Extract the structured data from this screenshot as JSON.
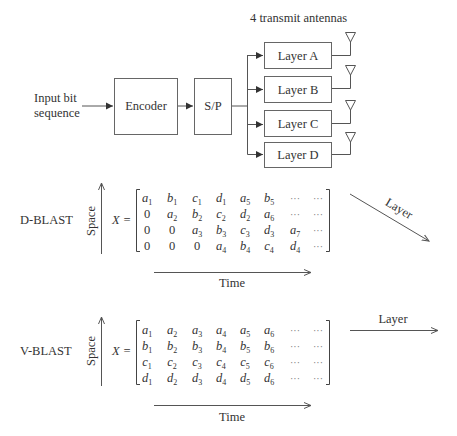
{
  "colors": {
    "ink": "#333333",
    "line": "#555555",
    "background": "#ffffff"
  },
  "block_diagram": {
    "title": "4 transmit antennas",
    "input_label": [
      "Input bit",
      "sequence"
    ],
    "encoder_label": "Encoder",
    "sp_label": "S/P",
    "layers": [
      "Layer A",
      "Layer B",
      "Layer C",
      "Layer D"
    ],
    "antenna_icon": "antenna-triangle-icon"
  },
  "d_blast": {
    "name": "D-BLAST",
    "space_label": "Space",
    "time_label": "Time",
    "layer_label": "Layer",
    "matrix_lhs": "X =",
    "rows": [
      [
        [
          "a",
          "1"
        ],
        [
          "b",
          "1"
        ],
        [
          "c",
          "1"
        ],
        [
          "d",
          "1"
        ],
        [
          "a",
          "5"
        ],
        [
          "b",
          "5"
        ],
        [
          "…",
          ""
        ],
        [
          "…",
          ""
        ]
      ],
      [
        [
          "0",
          ""
        ],
        [
          "a",
          "2"
        ],
        [
          "b",
          "2"
        ],
        [
          "c",
          "2"
        ],
        [
          "d",
          "2"
        ],
        [
          "a",
          "6"
        ],
        [
          "…",
          ""
        ],
        [
          "…",
          ""
        ]
      ],
      [
        [
          "0",
          ""
        ],
        [
          "0",
          ""
        ],
        [
          "a",
          "3"
        ],
        [
          "b",
          "3"
        ],
        [
          "c",
          "3"
        ],
        [
          "d",
          "3"
        ],
        [
          "a",
          "7"
        ],
        [
          "…",
          ""
        ]
      ],
      [
        [
          "0",
          ""
        ],
        [
          "0",
          ""
        ],
        [
          "0",
          ""
        ],
        [
          "a",
          "4"
        ],
        [
          "b",
          "4"
        ],
        [
          "c",
          "4"
        ],
        [
          "d",
          "4"
        ],
        [
          "…",
          ""
        ]
      ]
    ]
  },
  "v_blast": {
    "name": "V-BLAST",
    "space_label": "Space",
    "time_label": "Time",
    "layer_label": "Layer",
    "matrix_lhs": "X =",
    "rows": [
      [
        [
          "a",
          "1"
        ],
        [
          "a",
          "2"
        ],
        [
          "a",
          "3"
        ],
        [
          "a",
          "4"
        ],
        [
          "a",
          "5"
        ],
        [
          "a",
          "6"
        ],
        [
          "…",
          ""
        ],
        [
          "…",
          ""
        ]
      ],
      [
        [
          "b",
          "1"
        ],
        [
          "b",
          "2"
        ],
        [
          "b",
          "3"
        ],
        [
          "b",
          "4"
        ],
        [
          "b",
          "5"
        ],
        [
          "b",
          "6"
        ],
        [
          "…",
          ""
        ],
        [
          "…",
          ""
        ]
      ],
      [
        [
          "c",
          "1"
        ],
        [
          "c",
          "2"
        ],
        [
          "c",
          "3"
        ],
        [
          "c",
          "4"
        ],
        [
          "c",
          "5"
        ],
        [
          "c",
          "6"
        ],
        [
          "…",
          ""
        ],
        [
          "…",
          ""
        ]
      ],
      [
        [
          "d",
          "1"
        ],
        [
          "d",
          "2"
        ],
        [
          "d",
          "3"
        ],
        [
          "d",
          "4"
        ],
        [
          "d",
          "5"
        ],
        [
          "d",
          "6"
        ],
        [
          "…",
          ""
        ],
        [
          "…",
          ""
        ]
      ]
    ]
  }
}
